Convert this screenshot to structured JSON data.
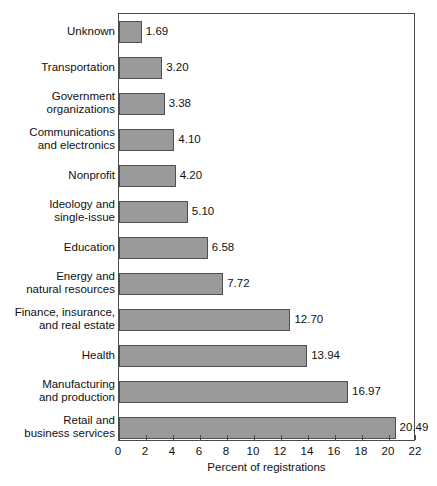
{
  "chart_data": {
    "type": "bar",
    "orientation": "horizontal",
    "title": "",
    "xlabel": "Percent of registrations",
    "ylabel": "",
    "xlim": [
      0,
      22
    ],
    "xticks": [
      0,
      2,
      4,
      6,
      8,
      10,
      12,
      14,
      16,
      18,
      20,
      22
    ],
    "grid": false,
    "legend": false,
    "bar_color": "#9a9a9a",
    "bar_border_color": "#4f4f4f",
    "categories": [
      "Unknown",
      "Transportation",
      "Government\norganizations",
      "Communications\nand electronics",
      "Nonprofit",
      "Ideology and\nsingle-issue",
      "Education",
      "Energy and\nnatural resources",
      "Finance, insurance,\nand real estate",
      "Health",
      "Manufacturing\nand production",
      "Retail and\nbusiness services"
    ],
    "values": [
      1.69,
      3.2,
      3.38,
      4.1,
      4.2,
      5.1,
      6.58,
      7.72,
      12.7,
      13.94,
      16.97,
      20.49
    ],
    "value_labels": [
      "1.69",
      "3.20",
      "3.38",
      "4.10",
      "4.20",
      "5.10",
      "6.58",
      "7.72",
      "12.70",
      "13.94",
      "16.97",
      "20.49"
    ]
  }
}
